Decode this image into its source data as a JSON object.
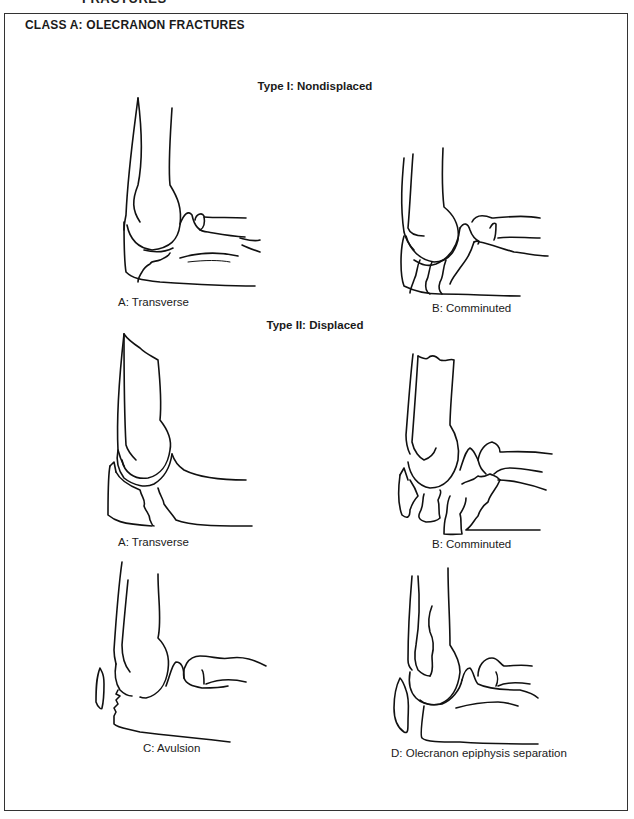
{
  "page_header_cropped": "FRACTURES",
  "class_title": "CLASS A: OLECRANON FRACTURES",
  "types": [
    {
      "heading": "Type I: Nondisplaced",
      "figures": [
        {
          "id": "type1-a",
          "caption": "A: Transverse",
          "icon": "elbow-transverse-nondisplaced-drawing"
        },
        {
          "id": "type1-b",
          "caption": "B: Comminuted",
          "icon": "elbow-comminuted-nondisplaced-drawing"
        }
      ]
    },
    {
      "heading": "Type II: Displaced",
      "figures": [
        {
          "id": "type2-a",
          "caption": "A: Transverse",
          "icon": "elbow-transverse-displaced-drawing"
        },
        {
          "id": "type2-b",
          "caption": "B: Comminuted",
          "icon": "elbow-comminuted-displaced-drawing"
        },
        {
          "id": "type2-c",
          "caption": "C: Avulsion",
          "icon": "elbow-avulsion-drawing"
        },
        {
          "id": "type2-d",
          "caption": "D: Olecranon epiphysis separation",
          "icon": "elbow-epiphysis-separation-drawing"
        }
      ]
    }
  ],
  "colors": {
    "line": "#111111",
    "frame": "#333333",
    "background": "#ffffff"
  }
}
